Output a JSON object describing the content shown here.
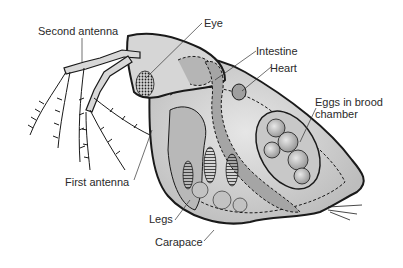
{
  "labels": {
    "second_antenna": "Second antenna",
    "eye": "Eye",
    "intestine": "Intestine",
    "heart": "Heart",
    "eggs_line1": "Eggs in brood",
    "eggs_line2": "chamber",
    "first_antenna": "First antenna",
    "legs": "Legs",
    "carapace": "Carapace"
  },
  "colors": {
    "outline": "#1a1a1a",
    "body_fill": "#cfcfcf",
    "body_light": "#e2e2e2",
    "organ_fill": "#a9a9a9",
    "text": "#2a2a2a"
  }
}
